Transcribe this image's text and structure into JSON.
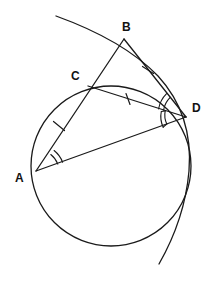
{
  "figure": {
    "kind": "geometry-diagram",
    "background_color": "#ffffff",
    "stroke_color": "#1a1a1a",
    "label_color": "#121212",
    "width": 214,
    "height": 291
  },
  "labels": [
    {
      "name": "A",
      "text": "A",
      "x": 15,
      "y": 172
    },
    {
      "name": "B",
      "text": "B",
      "x": 122,
      "y": 21
    },
    {
      "name": "C",
      "text": "C",
      "x": 71,
      "y": 70
    },
    {
      "name": "D",
      "text": "D",
      "x": 192,
      "y": 102
    }
  ],
  "points": {
    "A": {
      "x": 36,
      "y": 171
    },
    "B": {
      "x": 124,
      "y": 39
    },
    "C": {
      "x": 88,
      "y": 86
    },
    "D": {
      "x": 186,
      "y": 117
    }
  },
  "circle": {
    "name": "main-circle",
    "cx": 111,
    "cy": 166,
    "r": 80
  },
  "big_arc": {
    "name": "large-arc-through-B",
    "path": "M 56 16 C 92 29 130 47 158 76 C 181 101 192 134 189 171 C 186 205 175 236 159 264"
  },
  "segments": [
    {
      "name": "segment-AB",
      "x1": 36,
      "y1": 171,
      "x2": 124,
      "y2": 39
    },
    {
      "name": "segment-BD",
      "x1": 124,
      "y1": 39,
      "x2": 186,
      "y2": 117
    },
    {
      "name": "segment-CD",
      "x1": 88,
      "y1": 86,
      "x2": 186,
      "y2": 117
    },
    {
      "name": "segment-AD",
      "x1": 36,
      "y1": 171,
      "x2": 186,
      "y2": 117
    }
  ],
  "tick_marks": [
    {
      "name": "tick-on-AC",
      "on": "AC",
      "x": 59,
      "y": 126,
      "angle": -56
    },
    {
      "name": "tick-on-CD",
      "on": "CD",
      "x": 128,
      "y": 99,
      "angle": 17
    },
    {
      "name": "tick-on-BD",
      "on": "BD",
      "x": 148,
      "y": 70,
      "angle": 51
    }
  ],
  "angle_marks": [
    {
      "name": "angle-mark-at-A-inner",
      "vertex": "A",
      "radius": 22
    },
    {
      "name": "angle-mark-at-A-outer",
      "vertex": "A",
      "radius": 27
    },
    {
      "name": "angle-mark-at-D-upper-inner",
      "vertex": "D",
      "radius": 23
    },
    {
      "name": "angle-mark-at-D-upper-outer",
      "vertex": "D",
      "radius": 28
    },
    {
      "name": "angle-mark-at-D-lower-inner",
      "vertex": "D",
      "radius": 21
    },
    {
      "name": "angle-mark-at-D-lower-outer",
      "vertex": "D",
      "radius": 25
    }
  ]
}
